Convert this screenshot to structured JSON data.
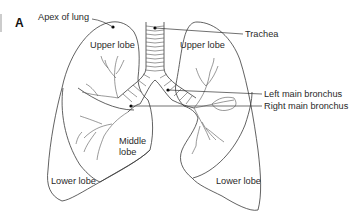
{
  "figure": {
    "panel_letter": "A",
    "labels": {
      "apex": "Apex of lung",
      "upper_lobe_right_lung": "Upper lobe",
      "upper_lobe_left_lung": "Upper lobe",
      "trachea": "Trachea",
      "left_main_bronchus": "Left main bronchus",
      "right_main_bronchus": "Right main bronchus",
      "middle_lobe_line1": "Middle",
      "middle_lobe_line2": "lobe",
      "lower_lobe_right_lung": "Lower lobe",
      "lower_lobe_left_lung": "Lower lobe"
    },
    "colors": {
      "line": "#3a3a3a",
      "text": "#2a2a2a",
      "background": "#ffffff"
    }
  }
}
